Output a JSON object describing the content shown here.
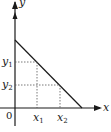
{
  "diagram": {
    "type": "coordinate-graph",
    "axes": {
      "x_label": "x",
      "y_label": "y",
      "origin_label": "0"
    },
    "points": [
      {
        "x_label": "x",
        "x_sub": "1",
        "y_label": "y",
        "y_sub": "1"
      },
      {
        "x_label": "x",
        "x_sub": "2",
        "y_label": "y",
        "y_sub": "2"
      }
    ],
    "colors": {
      "line": "#1a1a1a",
      "guides": "#555555",
      "background": "#ffffff"
    }
  }
}
